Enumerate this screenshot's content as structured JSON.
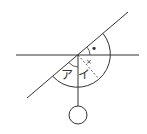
{
  "labels": {
    "angle_a": "ア",
    "angle_i": "イ",
    "dot_mark": "•",
    "cross_mark": "×"
  },
  "colors": {
    "stroke": "#333333",
    "background": "#ffffff"
  }
}
